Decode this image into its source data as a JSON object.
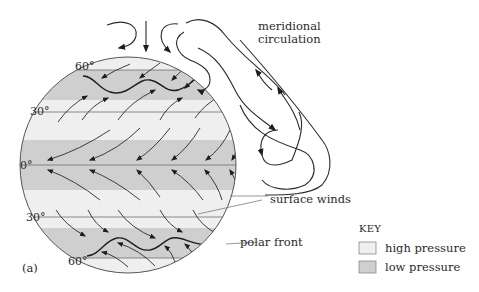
{
  "figure": {
    "panel_label": "(a)",
    "latitude_labels": {
      "n60": "60°",
      "n30": "30°",
      "eq": "0°",
      "s30": "30°",
      "s60": "60°"
    },
    "annotations": {
      "meridional_line1": "meridional",
      "meridional_line2": "circulation",
      "surface_winds": "surface winds",
      "polar_front": "polar front"
    },
    "key": {
      "title": "KEY",
      "items": [
        {
          "label": "high pressure",
          "color": "#efefef"
        },
        {
          "label": "low pressure",
          "color": "#cfcfcf"
        }
      ]
    },
    "bands": [
      {
        "name": "north-polar",
        "pressure": "high",
        "color": "#efefef"
      },
      {
        "name": "north-subpolar-low",
        "pressure": "low",
        "color": "#cfcfcf"
      },
      {
        "name": "north-subtropical-high",
        "pressure": "high",
        "color": "#efefef"
      },
      {
        "name": "equatorial-low",
        "pressure": "low",
        "color": "#cfcfcf"
      },
      {
        "name": "south-subtropical-high",
        "pressure": "high",
        "color": "#efefef"
      },
      {
        "name": "south-subpolar-low",
        "pressure": "low",
        "color": "#cfcfcf"
      },
      {
        "name": "south-polar",
        "pressure": "high",
        "color": "#efefef"
      }
    ],
    "colors": {
      "high_pressure": "#efefef",
      "low_pressure": "#cfcfcf",
      "line": "#2a2a2a"
    }
  }
}
